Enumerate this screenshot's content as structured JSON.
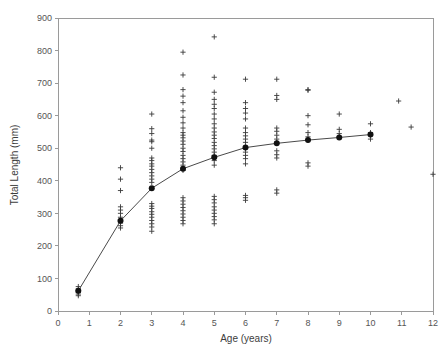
{
  "chart_data": {
    "type": "scatter",
    "title": "",
    "xlabel": "Age (years)",
    "ylabel": "Total Length (mm)",
    "xlim": [
      0,
      12
    ],
    "ylim": [
      0,
      900
    ],
    "xticks": [
      0,
      1,
      2,
      3,
      4,
      5,
      6,
      7,
      8,
      9,
      10,
      11,
      12
    ],
    "yticks": [
      0,
      100,
      200,
      300,
      400,
      500,
      600,
      700,
      800,
      900
    ],
    "xtick_labels": [
      "0",
      "1",
      "2",
      "3",
      "4",
      "5",
      "6",
      "7",
      "8",
      "9",
      "10",
      "11",
      "12"
    ],
    "ytick_labels": [
      "0",
      "100",
      "200",
      "300",
      "400",
      "500",
      "600",
      "700",
      "800",
      "900"
    ],
    "grid": false,
    "legend": null,
    "series": [
      {
        "name": "Individual observations",
        "marker": "plus",
        "points": [
          [
            0.65,
            75
          ],
          [
            0.65,
            68
          ],
          [
            0.65,
            63
          ],
          [
            0.65,
            60
          ],
          [
            0.65,
            57
          ],
          [
            0.65,
            52
          ],
          [
            0.65,
            47
          ],
          [
            2.0,
            440
          ],
          [
            2.0,
            405
          ],
          [
            2.0,
            370
          ],
          [
            2.0,
            320
          ],
          [
            2.0,
            310
          ],
          [
            2.0,
            300
          ],
          [
            2.0,
            288
          ],
          [
            2.0,
            280
          ],
          [
            2.0,
            275
          ],
          [
            2.0,
            270
          ],
          [
            2.0,
            262
          ],
          [
            2.0,
            255
          ],
          [
            3.0,
            605
          ],
          [
            3.0,
            560
          ],
          [
            3.0,
            545
          ],
          [
            3.0,
            525
          ],
          [
            3.0,
            520
          ],
          [
            3.0,
            500
          ],
          [
            3.0,
            470
          ],
          [
            3.0,
            462
          ],
          [
            3.0,
            452
          ],
          [
            3.0,
            445
          ],
          [
            3.0,
            435
          ],
          [
            3.0,
            425
          ],
          [
            3.0,
            415
          ],
          [
            3.0,
            405
          ],
          [
            3.0,
            395
          ],
          [
            3.0,
            330
          ],
          [
            3.0,
            322
          ],
          [
            3.0,
            315
          ],
          [
            3.0,
            305
          ],
          [
            3.0,
            297
          ],
          [
            3.0,
            288
          ],
          [
            3.0,
            278
          ],
          [
            3.0,
            268
          ],
          [
            3.0,
            258
          ],
          [
            3.0,
            245
          ],
          [
            4.0,
            795
          ],
          [
            4.0,
            725
          ],
          [
            4.0,
            680
          ],
          [
            4.0,
            660
          ],
          [
            4.0,
            640
          ],
          [
            4.0,
            615
          ],
          [
            4.0,
            595
          ],
          [
            4.0,
            578
          ],
          [
            4.0,
            562
          ],
          [
            4.0,
            548
          ],
          [
            4.0,
            540
          ],
          [
            4.0,
            532
          ],
          [
            4.0,
            522
          ],
          [
            4.0,
            512
          ],
          [
            4.0,
            500
          ],
          [
            4.0,
            490
          ],
          [
            4.0,
            478
          ],
          [
            4.0,
            468
          ],
          [
            4.0,
            458
          ],
          [
            4.0,
            448
          ],
          [
            4.0,
            432
          ],
          [
            4.0,
            348
          ],
          [
            4.0,
            338
          ],
          [
            4.0,
            328
          ],
          [
            4.0,
            318
          ],
          [
            4.0,
            308
          ],
          [
            4.0,
            298
          ],
          [
            4.0,
            288
          ],
          [
            4.0,
            278
          ],
          [
            4.0,
            268
          ],
          [
            5.0,
            842
          ],
          [
            5.0,
            718
          ],
          [
            5.0,
            672
          ],
          [
            5.0,
            650
          ],
          [
            5.0,
            635
          ],
          [
            5.0,
            622
          ],
          [
            5.0,
            605
          ],
          [
            5.0,
            590
          ],
          [
            5.0,
            575
          ],
          [
            5.0,
            562
          ],
          [
            5.0,
            550
          ],
          [
            5.0,
            540
          ],
          [
            5.0,
            530
          ],
          [
            5.0,
            518
          ],
          [
            5.0,
            508
          ],
          [
            5.0,
            498
          ],
          [
            5.0,
            488
          ],
          [
            5.0,
            478
          ],
          [
            5.0,
            462
          ],
          [
            5.0,
            448
          ],
          [
            5.0,
            352
          ],
          [
            5.0,
            342
          ],
          [
            5.0,
            332
          ],
          [
            5.0,
            320
          ],
          [
            5.0,
            310
          ],
          [
            5.0,
            300
          ],
          [
            5.0,
            290
          ],
          [
            5.0,
            280
          ],
          [
            5.0,
            268
          ],
          [
            6.0,
            712
          ],
          [
            6.0,
            640
          ],
          [
            6.0,
            622
          ],
          [
            6.0,
            608
          ],
          [
            6.0,
            590
          ],
          [
            6.0,
            562
          ],
          [
            6.0,
            548
          ],
          [
            6.0,
            538
          ],
          [
            6.0,
            528
          ],
          [
            6.0,
            518
          ],
          [
            6.0,
            500
          ],
          [
            6.0,
            488
          ],
          [
            6.0,
            478
          ],
          [
            6.0,
            468
          ],
          [
            6.0,
            452
          ],
          [
            6.0,
            355
          ],
          [
            6.0,
            348
          ],
          [
            6.0,
            340
          ],
          [
            7.0,
            712
          ],
          [
            7.0,
            662
          ],
          [
            7.0,
            650
          ],
          [
            7.0,
            562
          ],
          [
            7.0,
            552
          ],
          [
            7.0,
            540
          ],
          [
            7.0,
            528
          ],
          [
            7.0,
            518
          ],
          [
            7.0,
            492
          ],
          [
            7.0,
            480
          ],
          [
            7.0,
            470
          ],
          [
            7.0,
            372
          ],
          [
            7.0,
            362
          ],
          [
            8.0,
            680
          ],
          [
            8.0,
            678
          ],
          [
            8.0,
            600
          ],
          [
            8.0,
            572
          ],
          [
            8.0,
            548
          ],
          [
            8.0,
            535
          ],
          [
            8.0,
            525
          ],
          [
            8.0,
            455
          ],
          [
            8.0,
            445
          ],
          [
            9.0,
            605
          ],
          [
            9.0,
            558
          ],
          [
            9.0,
            545
          ],
          [
            9.0,
            535
          ],
          [
            10.0,
            575
          ],
          [
            10.0,
            548
          ],
          [
            10.0,
            540
          ],
          [
            10.0,
            528
          ],
          [
            10.9,
            645
          ],
          [
            11.3,
            565
          ],
          [
            12.0,
            420
          ]
        ]
      },
      {
        "name": "Mean total length at age",
        "marker": "filled-circle",
        "connected": true,
        "x": [
          0.65,
          2.0,
          3.0,
          4.0,
          5.0,
          6.0,
          7.0,
          8.0,
          9.0,
          10.0
        ],
        "y": [
          62,
          277,
          377,
          437,
          472,
          502,
          515,
          525,
          533,
          542
        ]
      }
    ]
  },
  "axes": {
    "y_title": "Total Length (mm)",
    "x_title": "Age (years)"
  }
}
